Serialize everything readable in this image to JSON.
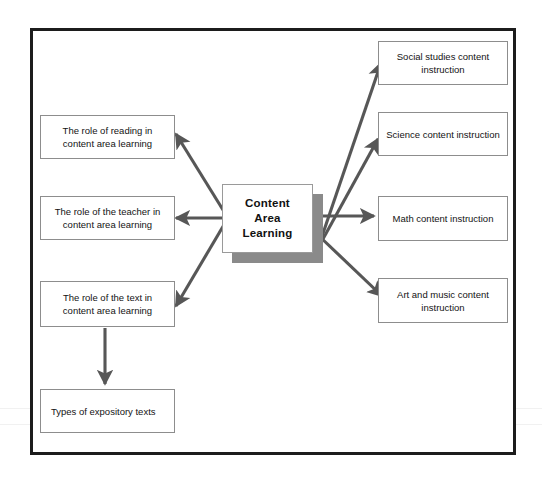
{
  "diagram": {
    "center": {
      "label": "Content\nArea\nLearning"
    },
    "left_nodes": [
      {
        "label": "The role of reading in content area learning"
      },
      {
        "label": "The role of the teacher in content area learning"
      },
      {
        "label": "The role of the text in content area learning"
      },
      {
        "label": "Types of expository texts"
      }
    ],
    "right_nodes": [
      {
        "label": "Social studies content instruction"
      },
      {
        "label": "Science content instruction"
      },
      {
        "label": "Math content instruction"
      },
      {
        "label": "Art and music content instruction"
      }
    ],
    "colors": {
      "frame_border": "#1c1c1c",
      "node_border": "#8d8d8d",
      "arrow": "#575757",
      "shadow": "#8a8a8a",
      "text": "#131313",
      "background": "#ffffff"
    }
  }
}
